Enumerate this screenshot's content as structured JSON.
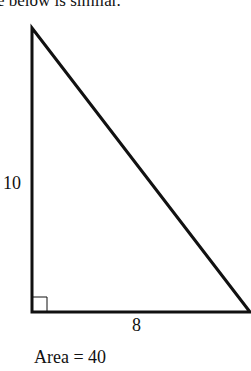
{
  "header": {
    "text": "e below is similar."
  },
  "triangle": {
    "vertices": {
      "top": [
        32,
        28
      ],
      "bottom_left": [
        32,
        312
      ],
      "bottom_right": [
        251,
        312
      ]
    },
    "stroke": "#111111",
    "right_angle_marker": true
  },
  "labels": {
    "height": "10",
    "base": "8",
    "area": "Area = 40"
  }
}
